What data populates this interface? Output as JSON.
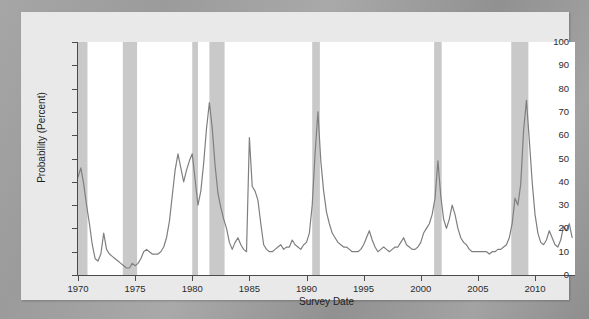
{
  "chart_data": {
    "type": "line",
    "title": "",
    "xlabel": "Survey Date",
    "ylabel": "Probability (Percent)",
    "xlim": [
      1970.0,
      2013.5
    ],
    "ylim": [
      0,
      100
    ],
    "grid": false,
    "legend": null,
    "x_ticks": [
      1970,
      1975,
      1980,
      1985,
      1990,
      1995,
      2000,
      2005,
      2010
    ],
    "x_tick_labels": [
      "1970",
      "1975",
      "1980",
      "1985",
      "1990",
      "1995",
      "2000",
      "2005",
      "2010"
    ],
    "y_ticks": [
      0,
      10,
      20,
      30,
      40,
      50,
      60,
      70,
      80,
      90,
      100
    ],
    "y_tick_labels": [
      "0",
      "10",
      "20",
      "30",
      "40",
      "50",
      "60",
      "70",
      "80",
      "90",
      "100"
    ],
    "line_color": "#7f7f7f",
    "shading_color": "#c9c9c9",
    "plot_background": "#ffffff",
    "figure_background": "#e9e9e9",
    "recession_bands": [
      {
        "start": 1970.0,
        "end": 1970.83
      },
      {
        "start": 1973.92,
        "end": 1975.17
      },
      {
        "start": 1980.0,
        "end": 1980.5
      },
      {
        "start": 1981.5,
        "end": 1982.83
      },
      {
        "start": 1990.5,
        "end": 1991.17
      },
      {
        "start": 2001.17,
        "end": 2001.83
      },
      {
        "start": 2007.92,
        "end": 2009.42
      }
    ],
    "series": [
      {
        "name": "Recession probability",
        "x": [
          1970.0,
          1970.25,
          1970.5,
          1970.75,
          1971.0,
          1971.25,
          1971.5,
          1971.75,
          1972.0,
          1972.25,
          1972.5,
          1972.75,
          1973.0,
          1973.25,
          1973.5,
          1973.75,
          1974.0,
          1974.25,
          1974.5,
          1974.75,
          1975.0,
          1975.25,
          1975.5,
          1975.75,
          1976.0,
          1976.25,
          1976.5,
          1976.75,
          1977.0,
          1977.25,
          1977.5,
          1977.75,
          1978.0,
          1978.25,
          1978.5,
          1978.75,
          1979.0,
          1979.25,
          1979.5,
          1979.75,
          1980.0,
          1980.25,
          1980.5,
          1980.75,
          1981.0,
          1981.25,
          1981.5,
          1981.75,
          1982.0,
          1982.25,
          1982.5,
          1982.75,
          1983.0,
          1983.25,
          1983.5,
          1983.75,
          1984.0,
          1984.25,
          1984.5,
          1984.75,
          1985.0,
          1985.25,
          1985.5,
          1985.75,
          1986.0,
          1986.25,
          1986.5,
          1986.75,
          1987.0,
          1987.25,
          1987.5,
          1987.75,
          1988.0,
          1988.25,
          1988.5,
          1988.75,
          1989.0,
          1989.25,
          1989.5,
          1989.75,
          1990.0,
          1990.25,
          1990.5,
          1990.75,
          1991.0,
          1991.25,
          1991.5,
          1991.75,
          1992.0,
          1992.25,
          1992.5,
          1992.75,
          1993.0,
          1993.25,
          1993.5,
          1993.75,
          1994.0,
          1994.25,
          1994.5,
          1994.75,
          1995.0,
          1995.25,
          1995.5,
          1995.75,
          1996.0,
          1996.25,
          1996.5,
          1996.75,
          1997.0,
          1997.25,
          1997.5,
          1997.75,
          1998.0,
          1998.25,
          1998.5,
          1998.75,
          1999.0,
          1999.25,
          1999.5,
          1999.75,
          2000.0,
          2000.25,
          2000.5,
          2000.75,
          2001.0,
          2001.25,
          2001.5,
          2001.75,
          2002.0,
          2002.25,
          2002.5,
          2002.75,
          2003.0,
          2003.25,
          2003.5,
          2003.75,
          2004.0,
          2004.25,
          2004.5,
          2004.75,
          2005.0,
          2005.25,
          2005.5,
          2005.75,
          2006.0,
          2006.25,
          2006.5,
          2006.75,
          2007.0,
          2007.25,
          2007.5,
          2007.75,
          2008.0,
          2008.25,
          2008.5,
          2008.75,
          2009.0,
          2009.25,
          2009.5,
          2009.75,
          2010.0,
          2010.25,
          2010.5,
          2010.75,
          2011.0,
          2011.25,
          2011.5,
          2011.75,
          2012.0,
          2012.25,
          2012.5,
          2012.75,
          2013.0,
          2013.25
        ],
        "y": [
          42,
          46,
          39,
          30,
          22,
          13,
          7,
          6,
          9,
          18,
          11,
          9,
          8,
          7,
          6,
          5,
          4,
          3,
          3,
          5,
          4,
          5,
          7,
          10,
          11,
          10,
          9,
          9,
          9,
          10,
          12,
          16,
          23,
          34,
          45,
          52,
          46,
          40,
          45,
          49,
          52,
          41,
          30,
          36,
          48,
          63,
          74,
          63,
          47,
          35,
          29,
          24,
          20,
          14,
          11,
          14,
          16,
          13,
          11,
          10,
          59,
          38,
          36,
          32,
          22,
          13,
          11,
          10,
          10,
          11,
          12,
          13,
          11,
          12,
          12,
          15,
          13,
          12,
          11,
          13,
          14,
          18,
          30,
          52,
          70,
          49,
          36,
          27,
          22,
          18,
          16,
          14,
          13,
          12,
          12,
          11,
          10,
          10,
          10,
          11,
          13,
          16,
          19,
          15,
          12,
          10,
          11,
          12,
          11,
          10,
          11,
          12,
          12,
          14,
          16,
          13,
          12,
          11,
          11,
          12,
          14,
          18,
          20,
          22,
          26,
          33,
          49,
          34,
          24,
          20,
          24,
          30,
          26,
          20,
          16,
          14,
          13,
          11,
          10,
          10,
          10,
          10,
          10,
          10,
          9,
          10,
          10,
          11,
          11,
          12,
          13,
          16,
          22,
          33,
          30,
          39,
          62,
          75,
          58,
          40,
          26,
          18,
          14,
          13,
          15,
          19,
          16,
          13,
          12,
          15,
          21,
          19,
          22,
          16
        ]
      }
    ]
  }
}
